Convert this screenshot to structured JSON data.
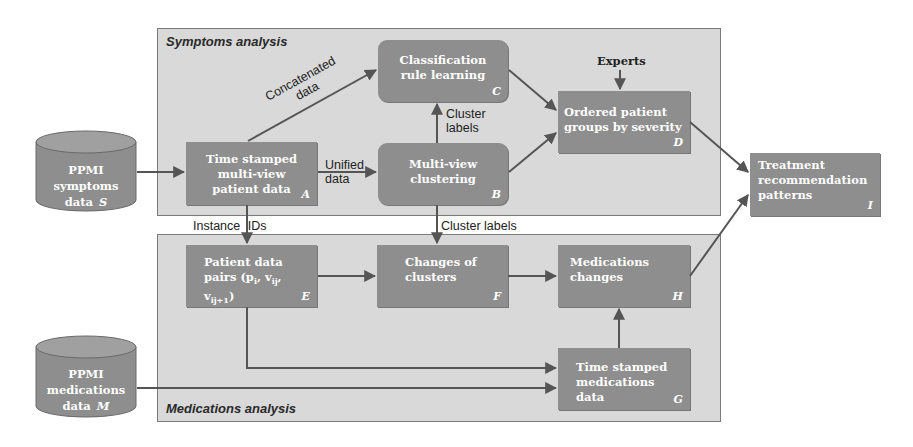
{
  "panels": {
    "symptoms": {
      "title": "Symptoms analysis"
    },
    "medications": {
      "title": "Medications analysis"
    }
  },
  "sources": {
    "symptoms": {
      "line1": "PPMI",
      "line2": "symptoms",
      "line3": "data",
      "tag": "S"
    },
    "medications": {
      "line1": "PPMI",
      "line2": "medications",
      "line3": "data",
      "tag": "M"
    }
  },
  "nodes": {
    "A": {
      "text": "Time stamped multi-view patient data",
      "tag": "A"
    },
    "B": {
      "text": "Multi-view clustering",
      "tag": "B"
    },
    "C": {
      "text": "Classification rule learning",
      "tag": "C"
    },
    "D": {
      "text": "Ordered patient groups by severity",
      "tag": "D"
    },
    "E": {
      "text_main": "Patient data pairs (p",
      "sub_i": "i",
      "sep1": ", v",
      "sub_ij": "ij",
      "sep2": ", v",
      "sub_ij1": "ij+1",
      "close": ")",
      "line1": "Patient data",
      "tag": "E"
    },
    "F": {
      "text": "Changes of clusters",
      "tag": "F"
    },
    "G": {
      "text": "Time stamped medications data",
      "tag": "G"
    },
    "H": {
      "text": "Medications changes",
      "tag": "H"
    },
    "I": {
      "text": "Treatment recommendation patterns",
      "tag": "I"
    }
  },
  "edge_labels": {
    "concatenated_1": "Concatenated",
    "concatenated_2": "data",
    "unified_1": "Unified",
    "unified_2": "data",
    "cluster_labels_1": "Cluster",
    "cluster_labels_2": "labels",
    "instance_ids": "Instance IDs",
    "cluster_labels_bottom": "Cluster labels",
    "experts": "Experts"
  },
  "colors": {
    "panel_fill": "#d9d9d9",
    "node_fill": "#8e8e8e",
    "arrow": "#555555",
    "node_text": "#ffffff"
  }
}
